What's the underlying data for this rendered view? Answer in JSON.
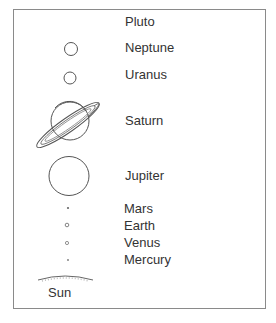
{
  "diagram": {
    "type": "solar-system-scale",
    "planets": [
      {
        "name": "Pluto",
        "label_x": 125,
        "label_y": 14
      },
      {
        "name": "Neptune",
        "label_x": 125,
        "label_y": 40
      },
      {
        "name": "Uranus",
        "label_x": 125,
        "label_y": 67
      },
      {
        "name": "Saturn",
        "label_x": 125,
        "label_y": 113
      },
      {
        "name": "Jupiter",
        "label_x": 125,
        "label_y": 168
      },
      {
        "name": "Mars",
        "label_x": 124,
        "label_y": 201
      },
      {
        "name": "Earth",
        "label_x": 124,
        "label_y": 218
      },
      {
        "name": "Venus",
        "label_x": 124,
        "label_y": 235
      },
      {
        "name": "Mercury",
        "label_x": 124,
        "label_y": 252
      }
    ],
    "sun": {
      "name": "Sun",
      "label_x": 48,
      "label_y": 285
    },
    "colors": {
      "stroke": "#555555",
      "text": "#333333",
      "frame": "#8a8a8a"
    }
  }
}
